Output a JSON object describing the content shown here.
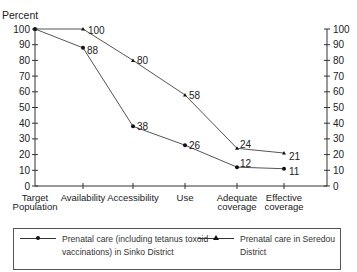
{
  "chart_data": {
    "type": "line",
    "title": "",
    "ylabel": "Percent",
    "xlabel": "",
    "ylim": [
      0,
      100
    ],
    "yticks": [
      0,
      10,
      20,
      30,
      40,
      50,
      60,
      70,
      80,
      90,
      100
    ],
    "right_axis": true,
    "grid": false,
    "legend_position": "bottom",
    "categories": [
      "Target Population",
      "Availability",
      "Accessibility",
      "Use",
      "Adequate coverage",
      "Effective coverage"
    ],
    "category_lines": [
      [
        "Target",
        "Population"
      ],
      [
        "Availability"
      ],
      [
        "Accessibility"
      ],
      [
        "Use"
      ],
      [
        "Adequate",
        "coverage"
      ],
      [
        "Effective",
        "coverage"
      ]
    ],
    "series": [
      {
        "name": "Prenatal care (including tetanus toxoid vaccinations) in Sinko District",
        "marker": "circle",
        "values": [
          100,
          88,
          38,
          26,
          12,
          11
        ],
        "labels": [
          "",
          "88",
          "38",
          "26",
          "12",
          "11"
        ]
      },
      {
        "name": "Prenatal care in Seredou District",
        "marker": "triangle",
        "values": [
          100,
          100,
          80,
          58,
          24,
          21
        ],
        "labels": [
          "",
          "100",
          "80",
          "58",
          "24",
          "21"
        ]
      }
    ]
  },
  "legend": {
    "item1_line1": "Prenatal care (including tetanus toxoid",
    "item1_line2": "vaccinations) in Sinko District",
    "item2": "Prenatal care in Seredou District"
  }
}
